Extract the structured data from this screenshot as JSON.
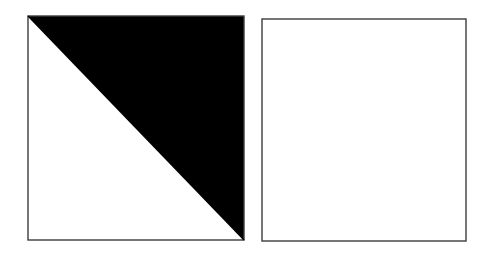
{
  "figure": {
    "background_color": "#ffffff",
    "canvas": {
      "width": 500,
      "height": 256
    },
    "shapes": [
      {
        "id": "square-half-filled",
        "name": "half-filled-square",
        "type": "square",
        "label": "Square with upper-right half shaded black",
        "x": 28,
        "y": 16,
        "width": 216,
        "height": 224,
        "stroke_color": "#3c3c3c",
        "stroke_width": 1.4,
        "fill_color": "#ffffff",
        "shading": {
          "present": true,
          "region": "upper-right triangle",
          "color": "#000000",
          "diagonal": "top-left to bottom-right",
          "fraction": "1/2"
        }
      },
      {
        "id": "square-empty",
        "name": "empty-square",
        "type": "square",
        "label": "Empty unshaded square",
        "x": 262,
        "y": 19,
        "width": 204,
        "height": 222,
        "stroke_color": "#3c3c3c",
        "stroke_width": 1.4,
        "fill_color": "#ffffff",
        "shading": {
          "present": false,
          "region": "none",
          "color": "#ffffff",
          "diagonal": "none",
          "fraction": "0"
        }
      }
    ]
  }
}
